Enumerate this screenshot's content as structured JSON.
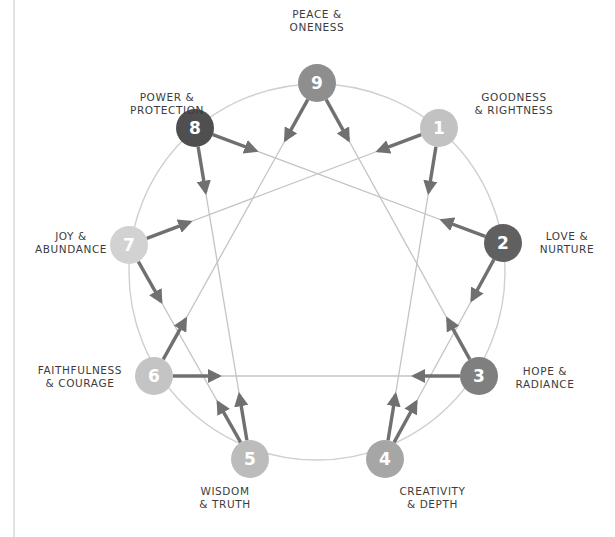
{
  "diagram": {
    "colors": {
      "circle": "#cfcfcf",
      "line": "#c4c4c4",
      "arrow": "#707070",
      "node_dark": "#5a5a5a",
      "node_mid": "#8c8c8c",
      "node_light": "#bdbdbd",
      "node_lighter": "#cfcfcf"
    },
    "circle": {
      "cx": 317,
      "cy": 272,
      "r": 188
    },
    "nodes": [
      {
        "id": "1",
        "number": "1",
        "x": 439,
        "y": 128,
        "fill": "#c2c2c2",
        "label_lines": [
          "GOODNESS",
          "& RIGHTNESS"
        ]
      },
      {
        "id": "2",
        "number": "2",
        "x": 503,
        "y": 243,
        "fill": "#606060",
        "label_lines": [
          "LOVE &",
          "NURTURE"
        ]
      },
      {
        "id": "3",
        "number": "3",
        "x": 479,
        "y": 376,
        "fill": "#7f7f7f",
        "label_lines": [
          "HOPE &",
          "RADIANCE"
        ]
      },
      {
        "id": "4",
        "number": "4",
        "x": 385,
        "y": 459,
        "fill": "#a6a6a6",
        "label_lines": [
          "CREATIVITY",
          "& DEPTH"
        ]
      },
      {
        "id": "5",
        "number": "5",
        "x": 250,
        "y": 459,
        "fill": "#bcbcbc",
        "label_lines": [
          "WISDOM",
          "& TRUTH"
        ]
      },
      {
        "id": "6",
        "number": "6",
        "x": 154,
        "y": 376,
        "fill": "#c4c4c4",
        "label_lines": [
          "FAITHFULNESS",
          "& COURAGE"
        ]
      },
      {
        "id": "7",
        "number": "7",
        "x": 129,
        "y": 245,
        "fill": "#d2d2d2",
        "label_lines": [
          "JOY &",
          "ABUNDANCE"
        ]
      },
      {
        "id": "8",
        "number": "8",
        "x": 195,
        "y": 128,
        "fill": "#4f4f4f",
        "label_lines": [
          "POWER &",
          "PROTECTION"
        ]
      },
      {
        "id": "9",
        "number": "9",
        "x": 317,
        "y": 83,
        "fill": "#8e8e8e",
        "label_lines": [
          "PEACE &",
          "ONENESS"
        ]
      }
    ],
    "connections": [
      [
        "1",
        "4"
      ],
      [
        "4",
        "2"
      ],
      [
        "2",
        "8"
      ],
      [
        "8",
        "5"
      ],
      [
        "5",
        "7"
      ],
      [
        "7",
        "1"
      ],
      [
        "3",
        "6"
      ],
      [
        "6",
        "9"
      ],
      [
        "9",
        "3"
      ]
    ],
    "arrows": [
      {
        "from": "9",
        "to": "6"
      },
      {
        "from": "9",
        "to": "3"
      },
      {
        "from": "8",
        "to": "2"
      },
      {
        "from": "8",
        "to": "5"
      },
      {
        "from": "1",
        "to": "7"
      },
      {
        "from": "1",
        "to": "4"
      },
      {
        "from": "2",
        "to": "8"
      },
      {
        "from": "2",
        "to": "4"
      },
      {
        "from": "3",
        "to": "6"
      },
      {
        "from": "3",
        "to": "9"
      },
      {
        "from": "4",
        "to": "1"
      },
      {
        "from": "4",
        "to": "2"
      },
      {
        "from": "5",
        "to": "7"
      },
      {
        "from": "5",
        "to": "8"
      },
      {
        "from": "6",
        "to": "3"
      },
      {
        "from": "6",
        "to": "9"
      },
      {
        "from": "7",
        "to": "1"
      },
      {
        "from": "7",
        "to": "5"
      }
    ],
    "labels": {
      "9": {
        "left": 270,
        "top": 8,
        "width": 94,
        "align": "center"
      },
      "1": {
        "left": 458,
        "top": 91,
        "width": 112,
        "align": "center"
      },
      "2": {
        "left": 527,
        "top": 230,
        "width": 80,
        "align": "center"
      },
      "3": {
        "left": 505,
        "top": 365,
        "width": 80,
        "align": "center"
      },
      "4": {
        "left": 390,
        "top": 485,
        "width": 85,
        "align": "center"
      },
      "5": {
        "left": 185,
        "top": 485,
        "width": 80,
        "align": "center"
      },
      "6": {
        "left": 25,
        "top": 364,
        "width": 110,
        "align": "center"
      },
      "7": {
        "left": 28,
        "top": 230,
        "width": 86,
        "align": "center"
      },
      "8": {
        "left": 118,
        "top": 91,
        "width": 98,
        "align": "center"
      }
    }
  }
}
